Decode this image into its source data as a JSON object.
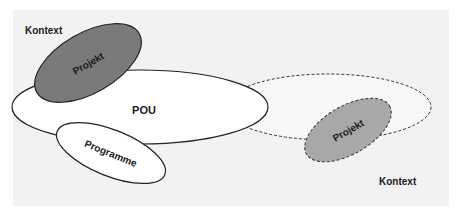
{
  "diagram": {
    "background_color": "#f2f2f2",
    "context_labels": [
      {
        "text": "Kontext",
        "position": "top-left"
      },
      {
        "text": "Kontext",
        "position": "bottom-right"
      }
    ],
    "ellipses": [
      {
        "id": "pou",
        "label": "POU",
        "fill": "#ffffff",
        "stroke": "solid"
      },
      {
        "id": "pou-outline",
        "label": "",
        "fill": "#f8f8f8",
        "stroke": "dashed"
      },
      {
        "id": "projekt-1",
        "label": "Projekt",
        "fill": "#7a7a7a",
        "stroke": "solid"
      },
      {
        "id": "projekt-2",
        "label": "Projekt",
        "fill": "#a8a8a8",
        "stroke": "dashed"
      },
      {
        "id": "programme",
        "label": "Programme",
        "fill": "#ffffff",
        "stroke": "solid"
      }
    ]
  }
}
